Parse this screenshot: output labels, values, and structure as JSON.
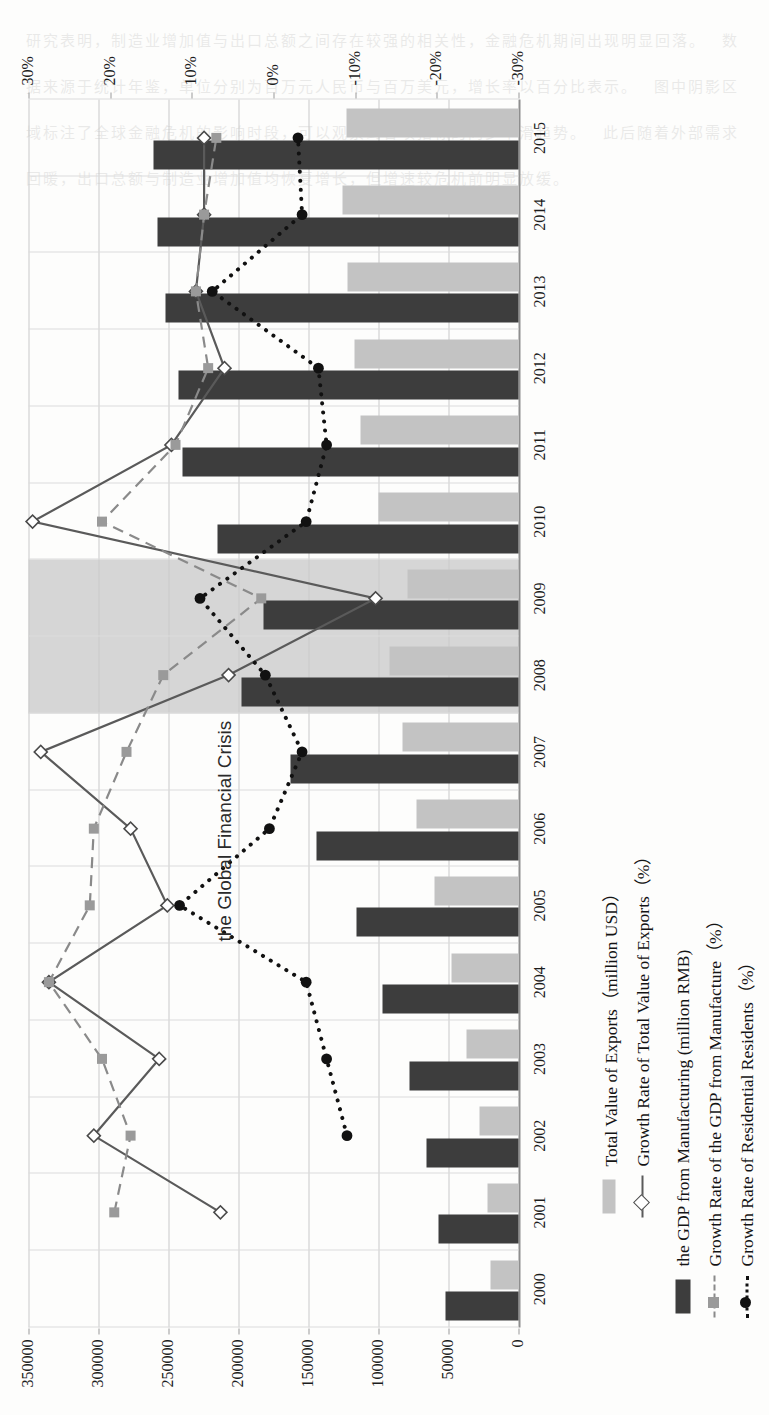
{
  "annotation": {
    "crisis_label": "the Global Financial Crisis"
  },
  "legend": {
    "top": [
      {
        "label": "Total Value of Exports（million USD）",
        "key": "bar-light"
      },
      {
        "label": "Growth Rate of Total Value of Exports（%）",
        "key": "line-solid-diamond"
      }
    ],
    "bottom": [
      {
        "label": "the GDP from Manufacturing (million RMB)",
        "key": "bar-dark"
      },
      {
        "label": "Growth Rate of the GDP from Manufacture（%）",
        "key": "line-dash-square"
      },
      {
        "label": "Growth Rate of Residential Residents（%）",
        "key": "line-dot-circle"
      }
    ]
  },
  "chart_data": {
    "type": "bar",
    "title": "",
    "xlabel": "",
    "ylabel": "",
    "y2label": "",
    "grid": true,
    "legend_position": "bottom",
    "categories": [
      "2000",
      "2001",
      "2002",
      "2003",
      "2004",
      "2005",
      "2006",
      "2007",
      "2008",
      "2009",
      "2010",
      "2011",
      "2012",
      "2013",
      "2014",
      "2015"
    ],
    "ylim": [
      0,
      350000
    ],
    "yticks": [
      0,
      50000,
      100000,
      150000,
      200000,
      250000,
      300000,
      350000
    ],
    "ytick_labels": [
      "0",
      "50000",
      "100000",
      "150000",
      "200000",
      "250000",
      "300000",
      "350000"
    ],
    "y2lim": [
      -30,
      30
    ],
    "y2ticks": [
      30,
      20,
      10,
      0,
      -10,
      -20,
      -30
    ],
    "y2tick_labels": [
      "30%",
      "20%",
      "10%",
      "0%",
      "-10%",
      "-20%",
      "-30%"
    ],
    "crisis_band_years": [
      "2008",
      "2009"
    ],
    "series": [
      {
        "name": "the GDP from Manufacturing (million RMB)",
        "type": "bar",
        "axis": "left",
        "color": "#3d3d3d",
        "values": [
          52000,
          57000,
          66000,
          78000,
          97000,
          116000,
          144000,
          163000,
          198000,
          182000,
          215000,
          240000,
          243000,
          252000,
          258000,
          261000
        ]
      },
      {
        "name": "Total Value of Exports（million USD）",
        "type": "bar",
        "axis": "left",
        "color": "#c3c3c3",
        "values": [
          20000,
          22000,
          28000,
          37000,
          48000,
          60000,
          73000,
          83000,
          92000,
          79000,
          100000,
          113000,
          117000,
          122000,
          126000,
          123000
        ]
      },
      {
        "name": "Growth Rate of Total Value of Exports（%）",
        "type": "line",
        "axis": "right",
        "style": "solid",
        "marker": "diamond",
        "color": "#5a5a5a",
        "values": [
          null,
          6.5,
          22.0,
          14.0,
          27.5,
          13.0,
          17.5,
          28.5,
          5.5,
          -12.5,
          29.5,
          12.5,
          6.0,
          9.5,
          8.5,
          8.5
        ]
      },
      {
        "name": "Growth Rate of the GDP from Manufacture（%）",
        "type": "line",
        "axis": "right",
        "style": "dashed",
        "marker": "square",
        "color": "#8a8a8a",
        "values": [
          null,
          19.5,
          17.5,
          21.0,
          27.5,
          22.5,
          22.0,
          18.0,
          13.5,
          1.5,
          21.0,
          12.0,
          8.0,
          9.5,
          8.5,
          7.0
        ]
      },
      {
        "name": "Growth Rate of Residential Residents（%）",
        "type": "line",
        "axis": "right",
        "style": "dotted",
        "marker": "circle",
        "color": "#111111",
        "values": [
          null,
          null,
          -9.0,
          -6.5,
          -4.0,
          11.5,
          0.5,
          -3.5,
          1.0,
          9.0,
          -4.0,
          -6.5,
          -5.5,
          7.5,
          -3.5,
          -3.0
        ]
      }
    ]
  }
}
